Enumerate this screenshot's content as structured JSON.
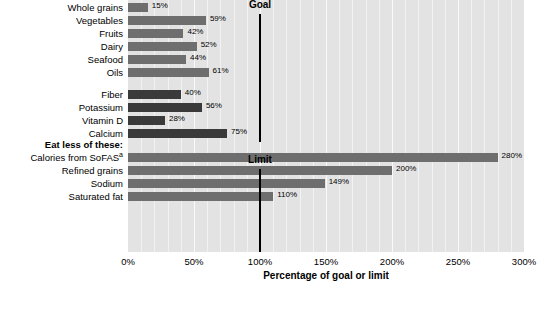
{
  "chart_data": {
    "type": "bar",
    "orientation": "horizontal",
    "title": "",
    "xlabel": "Percentage of goal or limit",
    "ylabel": "",
    "xlim": [
      0,
      300
    ],
    "xticks": [
      0,
      50,
      100,
      150,
      200,
      250,
      300
    ],
    "xtick_labels": [
      "0%",
      "50%",
      "100%",
      "150%",
      "200%",
      "250%",
      "300%"
    ],
    "grid": true,
    "grid_minor_step": 10,
    "legend": null,
    "reference_lines": [
      {
        "label": "Goal",
        "value": 100
      },
      {
        "label": "Limit",
        "value": 100
      }
    ],
    "group_headers": [
      {
        "label": "Eat less of these:"
      }
    ],
    "groups": [
      {
        "name": "food-groups",
        "color": "#6e6e6e",
        "categories": [
          "Whole grains",
          "Vegetables",
          "Fruits",
          "Dairy",
          "Seafood",
          "Oils"
        ],
        "values": [
          15,
          59,
          42,
          52,
          44,
          61
        ],
        "value_labels": [
          "15%",
          "59%",
          "42%",
          "52%",
          "44%",
          "61%"
        ]
      },
      {
        "name": "nutrients",
        "color": "#3a3a3a",
        "categories": [
          "Fiber",
          "Potassium",
          "Vitamin D",
          "Calcium"
        ],
        "values": [
          40,
          56,
          28,
          75
        ],
        "value_labels": [
          "40%",
          "56%",
          "28%",
          "75%"
        ]
      },
      {
        "name": "eat-less",
        "color": "#6e6e6e",
        "categories": [
          "Calories from SoFAS",
          "Refined grains",
          "Sodium",
          "Saturated fat"
        ],
        "category_superscripts": [
          "a",
          "",
          "",
          ""
        ],
        "values": [
          280,
          200,
          149,
          110
        ],
        "value_labels": [
          "280%",
          "200%",
          "149%",
          "110%"
        ]
      }
    ],
    "categories": [
      "Whole grains",
      "Vegetables",
      "Fruits",
      "Dairy",
      "Seafood",
      "Oils",
      "Fiber",
      "Potassium",
      "Vitamin D",
      "Calcium",
      "Calories from SoFAS",
      "Refined grains",
      "Sodium",
      "Saturated fat"
    ],
    "values": [
      15,
      59,
      42,
      52,
      44,
      61,
      40,
      56,
      28,
      75,
      280,
      200,
      149,
      110
    ]
  },
  "colors": {
    "plot_background": "#e3e3e3",
    "gridline": "#f4f4f4",
    "bar_light": "#6e6e6e",
    "bar_dark": "#3a3a3a",
    "reference_line": "#000000",
    "text": "#000000"
  }
}
